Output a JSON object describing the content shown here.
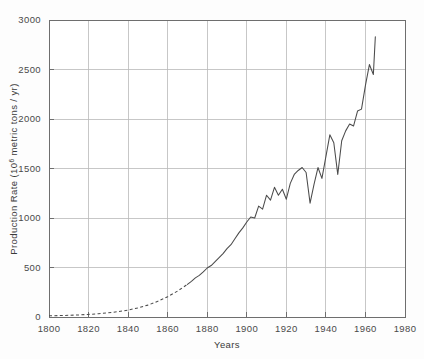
{
  "chart_data": {
    "type": "line",
    "title": "",
    "subtitle": "",
    "xlabel": "Years",
    "ylabel": "Production Rate (10⁶ metric tons / yr)",
    "ylabel_parts": {
      "prefix": "Production Rate (10",
      "exponent": "6",
      "suffix": " metric tons / yr)"
    },
    "xlim": [
      1800,
      1980
    ],
    "ylim": [
      0,
      3000
    ],
    "xticks": [
      1800,
      1820,
      1840,
      1860,
      1880,
      1900,
      1920,
      1940,
      1960,
      1980
    ],
    "xticklabels": [
      "1800",
      "1820",
      "1840",
      "1860",
      "1880",
      "1900",
      "1920",
      "1940",
      "1960",
      "1980"
    ],
    "yticks": [
      0,
      500,
      1000,
      1500,
      2000,
      2500,
      3000
    ],
    "yticklabels": [
      "0",
      "500",
      "1000",
      "1500",
      "2000",
      "2500",
      "3000"
    ],
    "grid": true,
    "grid_axes": "both",
    "legend": "none",
    "line_color": "#4b4b4b",
    "series": [
      {
        "name": "Production Rate",
        "style_segments": [
          {
            "style": "dashed",
            "x_range": [
              1800,
              1870
            ]
          },
          {
            "style": "solid",
            "x_range": [
              1870,
              1965
            ]
          }
        ],
        "x": [
          1800,
          1805,
          1810,
          1815,
          1820,
          1825,
          1830,
          1835,
          1840,
          1845,
          1850,
          1855,
          1860,
          1865,
          1870,
          1872,
          1874,
          1876,
          1878,
          1880,
          1882,
          1884,
          1886,
          1888,
          1890,
          1892,
          1894,
          1896,
          1898,
          1900,
          1902,
          1904,
          1906,
          1908,
          1910,
          1912,
          1914,
          1916,
          1918,
          1920,
          1922,
          1924,
          1926,
          1928,
          1930,
          1932,
          1934,
          1936,
          1938,
          1940,
          1942,
          1944,
          1946,
          1948,
          1950,
          1952,
          1954,
          1956,
          1958,
          1960,
          1962,
          1964,
          1965
        ],
        "y": [
          12,
          14,
          17,
          21,
          26,
          33,
          42,
          54,
          70,
          92,
          120,
          158,
          205,
          262,
          330,
          360,
          395,
          420,
          455,
          495,
          520,
          560,
          600,
          640,
          690,
          730,
          790,
          850,
          900,
          960,
          1010,
          1000,
          1120,
          1090,
          1230,
          1180,
          1310,
          1230,
          1290,
          1190,
          1350,
          1440,
          1480,
          1510,
          1460,
          1150,
          1340,
          1510,
          1400,
          1620,
          1840,
          1760,
          1440,
          1780,
          1880,
          1950,
          1930,
          2080,
          2100,
          2340,
          2550,
          2450,
          2830
        ]
      }
    ]
  },
  "axis": {
    "x_title": "Years",
    "y_title_prefix": "Production Rate (10",
    "y_title_exponent": "6",
    "y_title_suffix": " metric tons / yr)"
  }
}
